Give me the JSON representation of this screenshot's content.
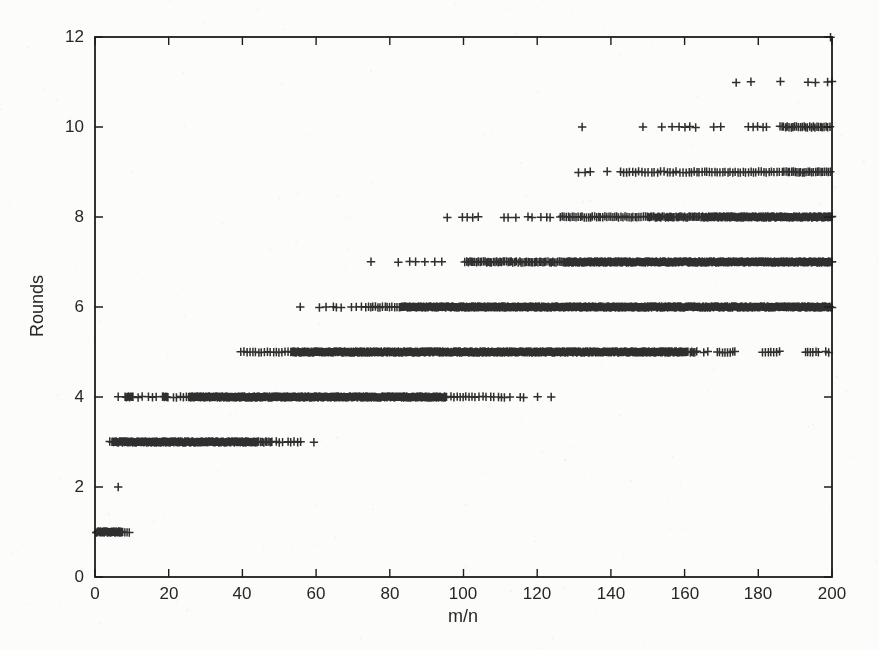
{
  "figure": {
    "background": "#fcfcfb",
    "ink": "#1d1d1d"
  },
  "chart_data": {
    "type": "scatter",
    "title": "",
    "xlabel": "m/n",
    "ylabel": "Rounds",
    "xlim": [
      0,
      200
    ],
    "ylim": [
      0,
      12
    ],
    "grid": false,
    "legend": "none",
    "marker": "plus",
    "marker_color": "#1d1d1d",
    "x_tick_values": [
      0,
      20,
      40,
      60,
      80,
      100,
      120,
      140,
      160,
      180,
      200
    ],
    "x_tick_labels": [
      "0",
      "20",
      "40",
      "60",
      "80",
      "100",
      "120",
      "140",
      "160",
      "180",
      "200"
    ],
    "y_tick_values": [
      0,
      2,
      4,
      6,
      8,
      10,
      12
    ],
    "y_tick_labels": [
      "0",
      "2",
      "4",
      "6",
      "8",
      "10",
      "12"
    ],
    "bands": [
      {
        "rounds": 1,
        "segments": [
          {
            "x0": 0.3,
            "x1": 7.6,
            "step": 0.18
          }
        ],
        "points": [
          8.1,
          8.7,
          9.3
        ]
      },
      {
        "rounds": 2,
        "segments": [],
        "points": [
          6.3
        ]
      },
      {
        "rounds": 3,
        "segments": [
          {
            "x0": 4.6,
            "x1": 44.0,
            "step": 0.2
          },
          {
            "x0": 44.0,
            "x1": 48.2,
            "step": 0.45
          }
        ],
        "points": [
          4.0,
          49.2,
          50.0,
          50.9,
          52.4,
          53.1,
          54.0,
          55.0,
          55.8,
          59.4
        ]
      },
      {
        "rounds": 4,
        "segments": [
          {
            "x0": 8.2,
            "x1": 10.4,
            "step": 0.3
          },
          {
            "x0": 18.3,
            "x1": 19.9,
            "step": 0.3
          },
          {
            "x0": 25.4,
            "x1": 95.5,
            "step": 0.2
          }
        ],
        "points": [
          6.3,
          11.7,
          12.8,
          14.5,
          15.6,
          16.6,
          21.3,
          22.1,
          23.2,
          24.0,
          24.8,
          96.6,
          97.4,
          98.3,
          99.1,
          99.9,
          100.6,
          101.5,
          102.3,
          103.1,
          104.2,
          105.3,
          106.1,
          107.4,
          108.2,
          109.5,
          110.3,
          111.1,
          112.6,
          115.4,
          116.3,
          120.1,
          123.8
        ]
      },
      {
        "rounds": 5,
        "segments": [
          {
            "x0": 39.6,
            "x1": 53.5,
            "step": 0.8
          },
          {
            "x0": 53.5,
            "x1": 161.0,
            "step": 0.2
          },
          {
            "x0": 161.5,
            "x1": 163.5,
            "step": 0.45
          },
          {
            "x0": 168.8,
            "x1": 174.2,
            "step": 0.7
          },
          {
            "x0": 181.2,
            "x1": 186.4,
            "step": 0.75
          },
          {
            "x0": 192.8,
            "x1": 196.4,
            "step": 0.7
          }
        ],
        "points": [
          165.2,
          166.3,
          198.3,
          199.1
        ]
      },
      {
        "rounds": 6,
        "segments": [
          {
            "x0": 73.5,
            "x1": 83.0,
            "step": 0.65
          },
          {
            "x0": 83.0,
            "x1": 200.0,
            "step": 0.2
          }
        ],
        "points": [
          55.7,
          60.9,
          62.7,
          64.7,
          65.5,
          66.8,
          69.6,
          70.9,
          72.3
        ]
      },
      {
        "rounds": 7,
        "segments": [
          {
            "x0": 100.4,
            "x1": 127.0,
            "step": 0.45
          },
          {
            "x0": 127.0,
            "x1": 200.0,
            "step": 0.2
          }
        ],
        "points": [
          74.9,
          82.3,
          85.4,
          87.0,
          89.5,
          92.2,
          94.1
        ]
      },
      {
        "rounds": 8,
        "segments": [
          {
            "x0": 126.2,
            "x1": 150.0,
            "step": 0.55
          },
          {
            "x0": 150.0,
            "x1": 165.0,
            "step": 0.4
          },
          {
            "x0": 165.0,
            "x1": 200.0,
            "step": 0.22
          }
        ],
        "points": [
          95.6,
          99.7,
          101.0,
          102.5,
          104.0,
          111.0,
          112.1,
          114.2,
          117.5,
          118.6,
          121.0,
          122.6,
          123.5
        ]
      },
      {
        "rounds": 9,
        "segments": [
          {
            "x0": 142.5,
            "x1": 160.0,
            "step": 0.85
          },
          {
            "x0": 160.5,
            "x1": 186.0,
            "step": 0.7
          },
          {
            "x0": 186.5,
            "x1": 199.5,
            "step": 0.5
          }
        ],
        "points": [
          131.2,
          133.0,
          134.4,
          139.0
        ]
      },
      {
        "rounds": 10,
        "segments": [
          {
            "x0": 185.9,
            "x1": 199.8,
            "step": 0.5
          }
        ],
        "points": [
          132.2,
          148.7,
          153.8,
          156.6,
          158.5,
          160.1,
          161.4,
          163.0,
          167.9,
          169.8,
          177.3,
          178.6,
          179.8,
          181.3,
          182.2
        ]
      },
      {
        "rounds": 11,
        "segments": [],
        "points": [
          174.0,
          178.0,
          186.0,
          193.5,
          195.5,
          198.8,
          200.0
        ]
      },
      {
        "rounds": 12,
        "segments": [],
        "points": [
          199.6
        ]
      }
    ]
  }
}
